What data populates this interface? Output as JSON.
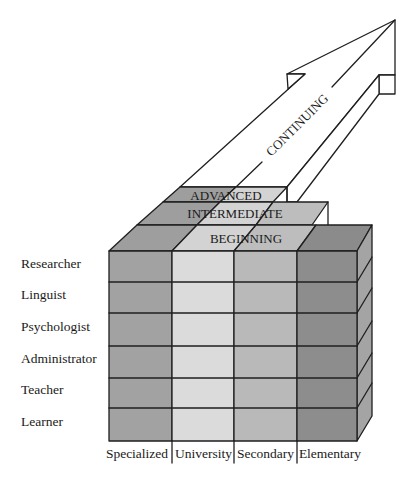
{
  "figure": {
    "arrow": {
      "label": "CONTINUING"
    },
    "levels": {
      "advanced": "ADVANCED",
      "intermediate": "INTERMEDIATE",
      "beginning": "BEGINNING"
    },
    "roles": [
      "Researcher",
      "Linguist",
      "Psychologist",
      "Administrator",
      "Teacher",
      "Learner"
    ],
    "settings": [
      "Specialized",
      "University",
      "Secondary",
      "Elementary"
    ]
  },
  "colors": {
    "background": "#ffffff",
    "outline": "#1f1f1f",
    "arrow_fill": "#ffffff",
    "specialized_front": "#a2a2a2",
    "university_front": "#dbdbdb",
    "secondary_front": "#b9b9b9",
    "elementary_front": "#8d8d8d",
    "side_face": "#a4a4a4",
    "specialized_top": "#9e9e9e",
    "university_top": "#d3d3d3",
    "secondary_top": "#bdbdbd",
    "elementary_top": "#8b8b8b"
  }
}
